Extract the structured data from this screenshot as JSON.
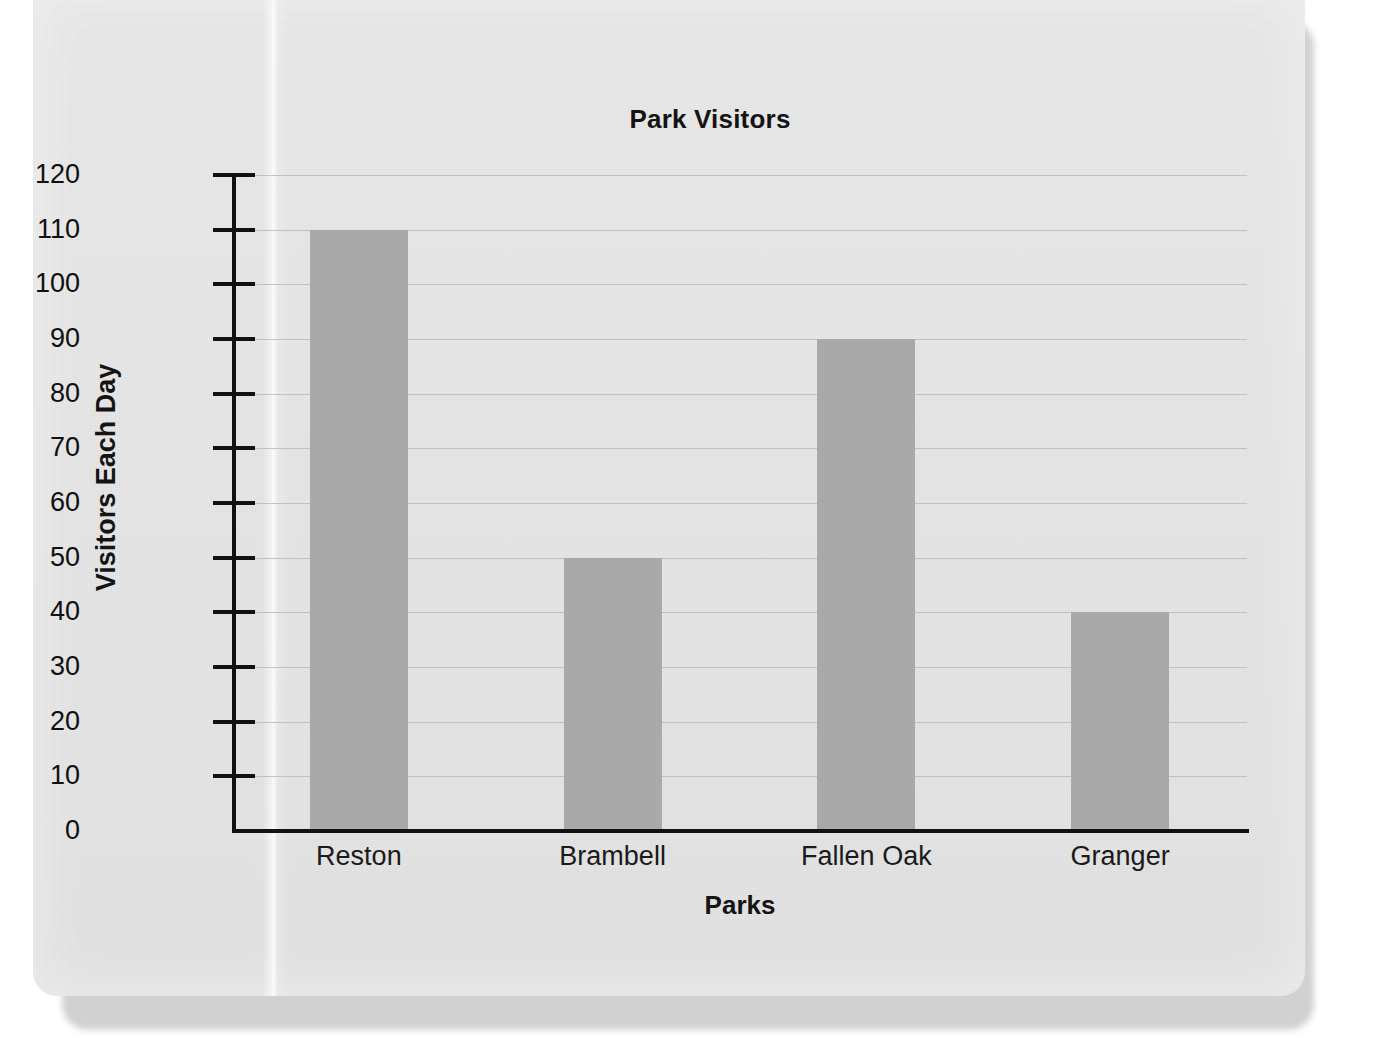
{
  "chart_data": {
    "type": "bar",
    "title": "Park Visitors",
    "xlabel": "Parks",
    "ylabel": "Visitors Each Day",
    "categories": [
      "Reston",
      "Brambell",
      "Fallen Oak",
      "Granger"
    ],
    "values": [
      110,
      50,
      90,
      40
    ],
    "ylim": [
      0,
      120
    ],
    "ytick_step": 10,
    "yticks": [
      "120",
      "110",
      "100",
      "90",
      "80",
      "70",
      "60",
      "50",
      "40",
      "30",
      "20",
      "10",
      "0"
    ],
    "grid": "horizontal",
    "legend": "none",
    "bar_color": "#a9a9a9",
    "axis_color": "#111111",
    "gridline_color": "#b4b4b4",
    "page_color": "#e7e7e7",
    "text_color": "#141414"
  }
}
